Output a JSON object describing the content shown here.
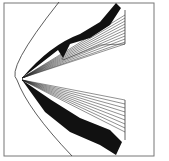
{
  "figure": {
    "caption": "",
    "colors": {
      "ink": "#111111",
      "frame": "#777777",
      "background": "#ffffff"
    }
  }
}
